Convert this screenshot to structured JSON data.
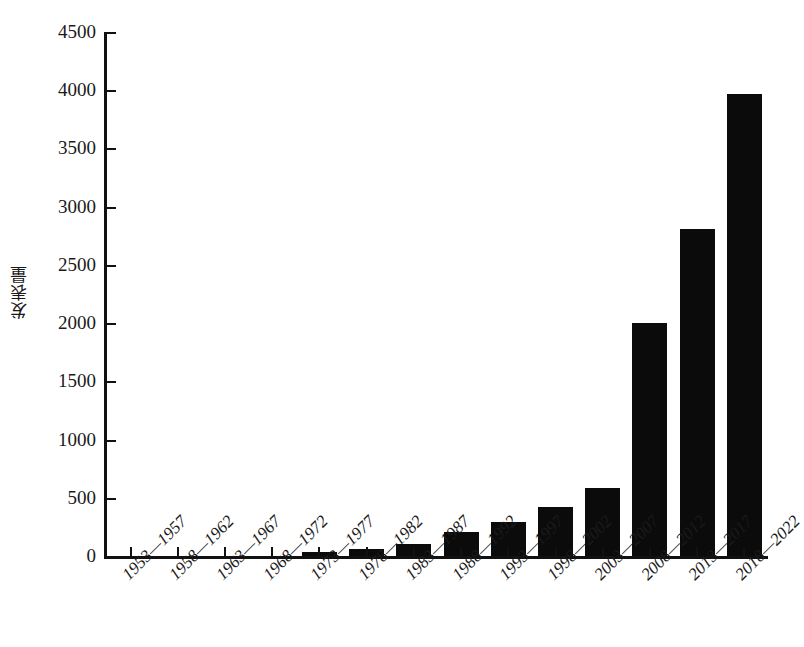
{
  "figure": {
    "top_caption_sliver": "",
    "background_color": "#ffffff",
    "bar_color": "#0b0b0b",
    "axis_color": "#111111"
  },
  "chart_data": {
    "type": "bar",
    "title": "",
    "xlabel": "",
    "ylabel": "发表量",
    "ylim": [
      0,
      4500
    ],
    "ytick_step": 500,
    "grid": false,
    "legend": null,
    "categories": [
      "1953—1957",
      "1958—1962",
      "1963—1967",
      "1968—1972",
      "1973—1977",
      "1978—1982",
      "1983—1987",
      "1988—1992",
      "1993—1997",
      "1998—2002",
      "2003—2007",
      "2008—2012",
      "2013—2017",
      "2018—2022"
    ],
    "values": [
      0,
      0,
      0,
      0,
      35,
      60,
      105,
      210,
      295,
      425,
      580,
      2005,
      2805,
      3965
    ],
    "ytick_labels": [
      "0",
      "500",
      "1000",
      "1500",
      "2000",
      "2500",
      "3000",
      "3500",
      "4000",
      "4500"
    ],
    "ytick_values": [
      0,
      500,
      1000,
      1500,
      2000,
      2500,
      3000,
      3500,
      4000,
      4500
    ]
  }
}
